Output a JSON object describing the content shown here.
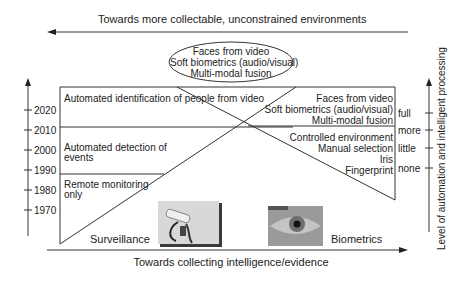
{
  "top_arrow": {
    "label": "Towards more collectable, unconstrained environments"
  },
  "ellipse": {
    "lines": [
      "Faces from video",
      "Soft biometrics (audio/visual)",
      "Multi-modal fusion"
    ]
  },
  "left_axis": {
    "ticks": [
      "2020",
      "2010",
      "2000",
      "1990",
      "1980",
      "1970"
    ]
  },
  "surveillance": {
    "title": "Surveillance",
    "stages": [
      {
        "lines": [
          "Automated identification of people from video"
        ]
      },
      {
        "lines": [
          "Automated detection of",
          "events"
        ]
      },
      {
        "lines": [
          "Remote monitoring",
          "only"
        ]
      }
    ],
    "image": "cctv-camera-photo"
  },
  "biometrics": {
    "title": "Biometrics",
    "stages": [
      {
        "lines": [
          "Faces from video",
          "Soft biometrics (audio/visual)",
          "Multi-modal fusion"
        ]
      },
      {
        "lines": [
          "Controlled environment",
          "Manual selection",
          "Iris",
          "Fingerprint"
        ]
      }
    ],
    "image": "eye-iris-photo"
  },
  "right_axis": {
    "label": "Level of automation and intelligent processing",
    "ticks": [
      "full",
      "more",
      "little",
      "none"
    ]
  },
  "bottom_arrow": {
    "label": "Towards collecting intelligence/evidence"
  }
}
